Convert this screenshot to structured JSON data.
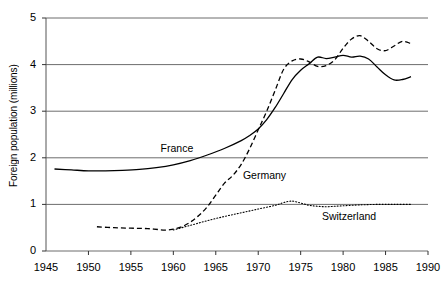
{
  "chart_data": {
    "type": "line",
    "title": "",
    "xlabel": "",
    "ylabel": "Foreign population (millions)",
    "xlim": [
      1945,
      1990
    ],
    "ylim": [
      0,
      5
    ],
    "xticks": [
      1945,
      1950,
      1955,
      1960,
      1965,
      1970,
      1975,
      1980,
      1985,
      1990
    ],
    "yticks": [
      0,
      1,
      2,
      3,
      4,
      5
    ],
    "grid": "horizontal",
    "legend_position": "inline-annotations",
    "series": [
      {
        "name": "France",
        "style": "solid",
        "color": "#000000",
        "label_x": 1958.5,
        "label_y": 2.18,
        "points": [
          [
            1946,
            1.76
          ],
          [
            1948,
            1.74
          ],
          [
            1950,
            1.72
          ],
          [
            1952,
            1.72
          ],
          [
            1954,
            1.73
          ],
          [
            1956,
            1.75
          ],
          [
            1958,
            1.79
          ],
          [
            1960,
            1.85
          ],
          [
            1962,
            1.94
          ],
          [
            1964,
            2.06
          ],
          [
            1966,
            2.2
          ],
          [
            1968,
            2.37
          ],
          [
            1969,
            2.48
          ],
          [
            1970,
            2.62
          ],
          [
            1971,
            2.82
          ],
          [
            1972,
            3.08
          ],
          [
            1973,
            3.38
          ],
          [
            1974,
            3.68
          ],
          [
            1975,
            3.88
          ],
          [
            1976,
            4.02
          ],
          [
            1977,
            4.16
          ],
          [
            1978,
            4.13
          ],
          [
            1979,
            4.16
          ],
          [
            1980,
            4.2
          ],
          [
            1981,
            4.16
          ],
          [
            1982,
            4.18
          ],
          [
            1983,
            4.12
          ],
          [
            1984,
            3.95
          ],
          [
            1985,
            3.78
          ],
          [
            1986,
            3.67
          ],
          [
            1987,
            3.68
          ],
          [
            1988,
            3.74
          ]
        ]
      },
      {
        "name": "Germany",
        "style": "dashed",
        "color": "#000000",
        "label_x": 1968.2,
        "label_y": 1.62,
        "points": [
          [
            1951,
            0.52
          ],
          [
            1953,
            0.5
          ],
          [
            1955,
            0.49
          ],
          [
            1957,
            0.48
          ],
          [
            1959,
            0.45
          ],
          [
            1960,
            0.47
          ],
          [
            1961,
            0.52
          ],
          [
            1962,
            0.62
          ],
          [
            1963,
            0.76
          ],
          [
            1964,
            0.95
          ],
          [
            1965,
            1.2
          ],
          [
            1966,
            1.45
          ],
          [
            1967,
            1.62
          ],
          [
            1968,
            1.86
          ],
          [
            1969,
            2.2
          ],
          [
            1970,
            2.6
          ],
          [
            1971,
            3.0
          ],
          [
            1972,
            3.45
          ],
          [
            1973,
            3.9
          ],
          [
            1974,
            4.08
          ],
          [
            1975,
            4.12
          ],
          [
            1976,
            4.06
          ],
          [
            1977,
            3.96
          ],
          [
            1978,
            3.98
          ],
          [
            1979,
            4.1
          ],
          [
            1980,
            4.35
          ],
          [
            1981,
            4.55
          ],
          [
            1982,
            4.62
          ],
          [
            1983,
            4.5
          ],
          [
            1984,
            4.34
          ],
          [
            1985,
            4.3
          ],
          [
            1986,
            4.4
          ],
          [
            1987,
            4.5
          ],
          [
            1988,
            4.45
          ]
        ]
      },
      {
        "name": "Switzerland",
        "style": "dotted",
        "color": "#000000",
        "label_x": 1977.5,
        "label_y": 0.72,
        "points": [
          [
            1960,
            0.45
          ],
          [
            1962,
            0.55
          ],
          [
            1964,
            0.65
          ],
          [
            1966,
            0.74
          ],
          [
            1968,
            0.82
          ],
          [
            1970,
            0.9
          ],
          [
            1972,
            0.98
          ],
          [
            1973,
            1.04
          ],
          [
            1974,
            1.07
          ],
          [
            1975,
            1.03
          ],
          [
            1976,
            0.98
          ],
          [
            1977,
            0.96
          ],
          [
            1978,
            0.95
          ],
          [
            1979,
            0.96
          ],
          [
            1980,
            0.97
          ],
          [
            1982,
            0.99
          ],
          [
            1984,
            1.0
          ],
          [
            1986,
            1.0
          ],
          [
            1988,
            1.0
          ]
        ]
      }
    ]
  }
}
